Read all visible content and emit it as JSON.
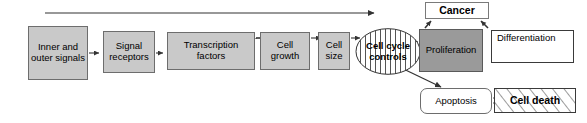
{
  "diagram": {
    "type": "flow-diagram",
    "background_color": "#ffffff",
    "colors": {
      "box_gray": "#c9c9c9",
      "box_dark_gray": "#9a9a9a",
      "box_white": "#ffffff",
      "line": "#333333",
      "text": "#000000"
    }
  },
  "nodes": {
    "inner_outer_signals": {
      "label": "Inner and outer signals",
      "style": "gray-box"
    },
    "signal_receptors": {
      "label": "Signal receptors",
      "style": "gray-box"
    },
    "transcription_factors": {
      "label": "Transcription factors",
      "style": "gray-box"
    },
    "cell_growth": {
      "label": "Cell growth",
      "style": "gray-box"
    },
    "cell_size": {
      "label": "Cell size",
      "style": "gray-box"
    },
    "cell_cycle_controls": {
      "label": "Cell cycle controls",
      "style": "striped-ellipse"
    },
    "proliferation": {
      "label": "Proliferation",
      "style": "dark-gray-box"
    },
    "differentiation": {
      "label": "Differentiation",
      "style": "white-box"
    },
    "cancer": {
      "label": "Cancer",
      "style": "white-box-bold"
    },
    "apoptosis": {
      "label": "Apoptosis",
      "style": "white-rounded-box"
    },
    "cell_death": {
      "label": "Cell death",
      "style": "hatched-box"
    }
  },
  "edges": [
    {
      "from": "inner_outer_signals",
      "to": "signal_receptors",
      "type": "arrow"
    },
    {
      "from": "signal_receptors",
      "to": "transcription_factors",
      "type": "arrow"
    },
    {
      "from": "transcription_factors",
      "to": "cell_growth",
      "type": "arrow"
    },
    {
      "from": "cell_growth",
      "to": "cell_size",
      "type": "arrow"
    },
    {
      "from": "cell_size",
      "to": "cell_cycle_controls",
      "type": "arrow"
    },
    {
      "from": "inner_outer_signals",
      "to": "cell_cycle_controls",
      "type": "long-top-arrow"
    },
    {
      "from": "cell_cycle_controls",
      "to": "proliferation",
      "type": "arrow"
    },
    {
      "from": "cell_cycle_controls",
      "to": "apoptosis",
      "type": "diagonal-arrow"
    },
    {
      "from": "proliferation",
      "to": "cancer",
      "type": "short-arrow-up-left"
    },
    {
      "from": "differentiation",
      "to": "cancer",
      "type": "short-arrow-up-right"
    },
    {
      "from": "apoptosis",
      "to": "cell_death",
      "type": "double-arrow"
    },
    {
      "from": "differentiation",
      "to": "differentiation",
      "type": "inline-arrow"
    }
  ]
}
